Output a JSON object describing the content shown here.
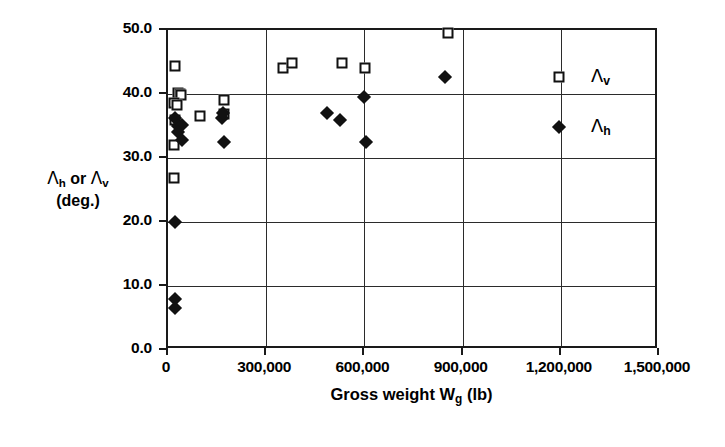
{
  "chart_data": {
    "type": "scatter",
    "title": "",
    "xlabel": "Gross weight W_g (lb)",
    "ylabel": "Λ_h or Λ_v (deg.)",
    "xlim": [
      0,
      1500000
    ],
    "ylim": [
      0,
      50
    ],
    "xticks": [
      0,
      300000,
      600000,
      900000,
      1200000,
      1500000
    ],
    "xticklabels": [
      "0",
      "300,000",
      "600,000",
      "900,000",
      "1,200,000",
      "1,500,000"
    ],
    "yticks": [
      0,
      10,
      20,
      30,
      40,
      50
    ],
    "yticklabels": [
      "0.0",
      "10.0",
      "20.0",
      "30.0",
      "40.0",
      "50.0"
    ],
    "grid": true,
    "legend_position": "inside-right",
    "series": [
      {
        "name": "Λ_v",
        "marker": "open-square",
        "color": "#111111",
        "points": [
          [
            21000,
            44.4
          ],
          [
            30000,
            40.1
          ],
          [
            36000,
            40.0
          ],
          [
            39000,
            39.9
          ],
          [
            18000,
            38.6
          ],
          [
            27000,
            38.3
          ],
          [
            21000,
            35.9
          ],
          [
            18000,
            32.0
          ],
          [
            18000,
            26.9
          ],
          [
            97000,
            36.6
          ],
          [
            170000,
            39.1
          ],
          [
            172000,
            36.8
          ],
          [
            352000,
            44.0
          ],
          [
            378000,
            44.9
          ],
          [
            533000,
            44.8
          ],
          [
            602000,
            44.1
          ],
          [
            855000,
            49.6
          ]
        ]
      },
      {
        "name": "Λ_h",
        "marker": "filled-diamond",
        "color": "#111111",
        "points": [
          [
            22000,
            36.2
          ],
          [
            30000,
            35.0
          ],
          [
            44000,
            35.1
          ],
          [
            31000,
            34.1
          ],
          [
            42000,
            32.8
          ],
          [
            172000,
            32.5
          ],
          [
            166000,
            36.3
          ],
          [
            168000,
            37.1
          ],
          [
            485000,
            37.0
          ],
          [
            524000,
            36.0
          ],
          [
            600000,
            39.6
          ],
          [
            604000,
            32.5
          ],
          [
            845000,
            42.6
          ],
          [
            20000,
            20.0
          ],
          [
            22000,
            8.0
          ],
          [
            22000,
            6.5
          ]
        ]
      }
    ]
  },
  "axes": {
    "y_title_line1_prefix": "Λ",
    "y_title_line1": "Λ",
    "y_title_text": "Λh or Λv",
    "y_title_unit": "(deg.)",
    "x_title_main": "Gross weight W",
    "x_title_sub": "g",
    "x_title_unit": "(lb)"
  },
  "legend": {
    "items": [
      {
        "label": "Λ",
        "sub": "v",
        "marker": "open-square"
      },
      {
        "label": "Λ",
        "sub": "h",
        "marker": "filled-diamond"
      }
    ]
  }
}
